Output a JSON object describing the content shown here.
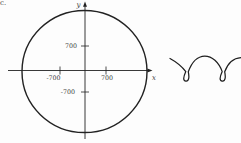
{
  "page": {
    "corner_label": "c.",
    "background": "#fdfdfd"
  },
  "colors": {
    "line": "#222222",
    "curve": "#1f1f1f",
    "text": "#3c3c3c"
  },
  "circle_plot": {
    "x_axis_label": "x",
    "y_axis_label": "y",
    "x_tick_positive": "700",
    "x_tick_negative": "-700",
    "y_tick_positive": "700",
    "y_tick_negative": "-700"
  },
  "shapes": {
    "left_figure": "circle-centered-at-origin",
    "right_figure": "prolate-cycloid-curve-with-loops"
  }
}
